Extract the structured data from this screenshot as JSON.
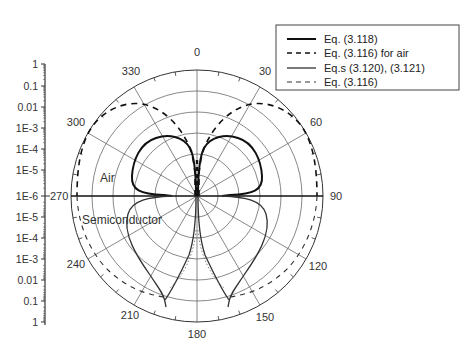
{
  "chart_data": {
    "type": "polar",
    "title": "",
    "angular_axis": {
      "tick_labels": [
        "0",
        "30",
        "60",
        "90",
        "120",
        "150",
        "180",
        "210",
        "240",
        "270",
        "300",
        "330"
      ],
      "zero_at": "top",
      "direction": "clockwise"
    },
    "radial_axis": {
      "scale": "log",
      "tick_labels_upper": [
        "1",
        "0.1",
        "0.01",
        "1E-3",
        "1E-4",
        "1E-5",
        "1E-6"
      ],
      "tick_labels_lower": [
        "1E-6",
        "1E-5",
        "1E-4",
        "1E-3",
        "0.01",
        "0.1",
        "1"
      ],
      "range": [
        1e-06,
        1
      ],
      "grid_rings": 6
    },
    "regions": {
      "upper": "Air",
      "lower": "Semiconductor"
    },
    "legend": {
      "position": "upper right",
      "entries": [
        {
          "label": "Eq. (3.118)",
          "style": "solid-thick"
        },
        {
          "label": "Eq. (3.116) for air",
          "style": "dashed-thick"
        },
        {
          "label": "Eq.s (3.120), (3.121)",
          "style": "solid-thin"
        },
        {
          "label": "Eq. (3.116)",
          "style": "dashed-thin"
        }
      ]
    },
    "series": [
      {
        "name": "Eq. (3.118)",
        "region": "air",
        "description": "two-lobe pattern, null at 0 deg and 90/270 deg, max ~0.01-0.1 decade level near +/-40 deg"
      },
      {
        "name": "Eq. (3.116) for air",
        "region": "air",
        "description": "dashed two-lobe pattern, max near outer ring (~0.1) around +/-45 deg, null at 0 deg"
      },
      {
        "name": "Eq.s (3.120), (3.121)",
        "region": "semiconductor",
        "description": "two-lobe pattern with cusps near 160/200 deg reaching ~0.1"
      },
      {
        "name": "Eq. (3.116)",
        "region": "semiconductor",
        "description": "dashed pattern along outer rings in semiconductor half, converging to cusps near 160/200 deg"
      }
    ]
  },
  "axis_labels": {
    "left_upper": [
      "1",
      "0.1",
      "0.01",
      "1E-3",
      "1E-4",
      "1E-5",
      "1E-6"
    ],
    "left_lower": [
      "1E-5",
      "1E-4",
      "1E-3",
      "0.01",
      "0.1",
      "1"
    ],
    "angles": {
      "a0": "0",
      "a30": "30",
      "a60": "60",
      "a90": "90",
      "a120": "120",
      "a150": "150",
      "a180": "180",
      "a210": "210",
      "a240": "240",
      "a270": "270",
      "a300": "300",
      "a330": "330"
    }
  },
  "regions": {
    "air": "Air",
    "semiconductor": "Semiconductor"
  },
  "legend": {
    "e1": "Eq. (3.118)",
    "e2": "Eq. (3.116) for air",
    "e3": "Eq.s (3.120), (3.121)",
    "e4": "Eq. (3.116)"
  }
}
